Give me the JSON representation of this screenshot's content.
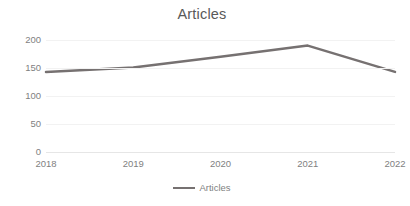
{
  "chart_data": {
    "type": "line",
    "title": "Articles",
    "xlabel": "",
    "ylabel": "",
    "categories": [
      "2018",
      "2019",
      "2020",
      "2021",
      "2022"
    ],
    "series": [
      {
        "name": "Articles",
        "values": [
          143,
          151,
          170,
          190,
          143
        ],
        "color": "#767171"
      }
    ],
    "ylim": [
      0,
      200
    ],
    "yticks": [
      0,
      50,
      100,
      150,
      200
    ],
    "ytick_labels": [
      "0",
      "50",
      "100",
      "150",
      "200"
    ],
    "grid": true,
    "grid_axis": "y",
    "legend": true,
    "legend_position": "bottom",
    "legend_entries": [
      "Articles"
    ],
    "markers": false,
    "line_width": 2.5,
    "background": "#ffffff",
    "grid_color": "#f2f2f2",
    "text_color": "#7f7f7f",
    "title_color": "#595959"
  },
  "legend": {
    "swatch_name": "line-swatch"
  }
}
